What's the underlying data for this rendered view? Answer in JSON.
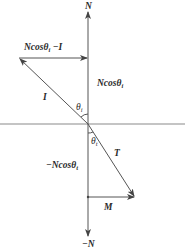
{
  "diagram": {
    "title": "",
    "colors": {
      "line": "#555555",
      "interface": "#8a8a8a",
      "text": "#2a2a2a",
      "background": "#ffffff"
    },
    "labels": {
      "normal_up": "N",
      "normal_down": "−N",
      "top_arrow": "Ncosθ",
      "top_arrow_sub": "i",
      "top_arrow_suffix": " −I",
      "normal_component_upper": "Ncosθ",
      "normal_component_upper_sub": "i",
      "incident_vector": "I",
      "incident_angle": "θ",
      "incident_angle_sub": "i",
      "transmitted_angle": "θ",
      "transmitted_angle_sub": "t",
      "transmitted_vector": "T",
      "normal_component_lower": "−Ncosθ",
      "normal_component_lower_sub": "t",
      "tangent_vector": "M"
    },
    "vectors": [
      {
        "name": "N",
        "from": [
          88,
          124
        ],
        "to": [
          88,
          10
        ]
      },
      {
        "name": "-N",
        "from": [
          88,
          124
        ],
        "to": [
          88,
          238
        ]
      },
      {
        "name": "I",
        "from": [
          88,
          124
        ],
        "to": [
          19,
          58
        ]
      },
      {
        "name": "Ncos(theta_i) - I",
        "from": [
          19,
          58
        ],
        "to": [
          88,
          58
        ]
      },
      {
        "name": "T",
        "from": [
          88,
          124
        ],
        "to": [
          135,
          197
        ]
      },
      {
        "name": "M",
        "from": [
          88,
          197
        ],
        "to": [
          135,
          197
        ]
      }
    ],
    "interface_line": {
      "y": 124,
      "x_from": 0,
      "x_to": 185
    }
  }
}
